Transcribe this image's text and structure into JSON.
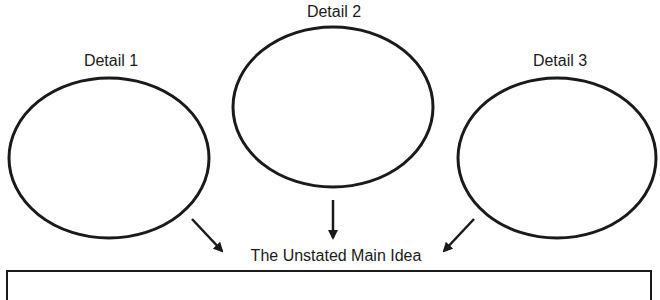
{
  "diagram": {
    "details": [
      {
        "label": "Detail 1"
      },
      {
        "label": "Detail 2"
      },
      {
        "label": "Detail 3"
      }
    ],
    "main_idea": {
      "label": "The Unstated Main Idea"
    }
  },
  "colors": {
    "stroke": "#1a1a1a",
    "background": "#ffffff"
  }
}
